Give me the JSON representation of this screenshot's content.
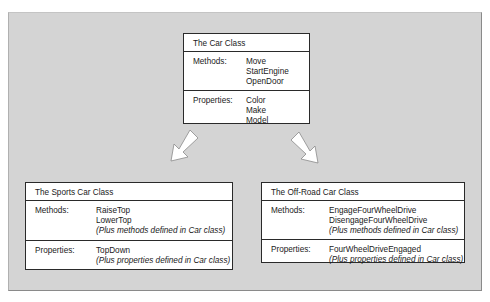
{
  "diagram": {
    "base_class": {
      "title": "The Car Class",
      "methods_label": "Methods:",
      "methods": [
        "Move",
        "StartEngine",
        "OpenDoor"
      ],
      "properties_label": "Properties:",
      "properties": [
        "Color",
        "Make",
        "Model"
      ]
    },
    "derived_classes": [
      {
        "title": "The Sports Car Class",
        "methods_label": "Methods:",
        "methods": [
          "RaiseTop",
          "LowerTop"
        ],
        "methods_note": "(Plus methods defined in Car class)",
        "properties_label": "Properties:",
        "properties": [
          "TopDown"
        ],
        "properties_note": "(Plus properties defined in Car class)"
      },
      {
        "title": "The Off-Road Car Class",
        "methods_label": "Methods:",
        "methods": [
          "EngageFourWheelDrive",
          "DisengageFourWheelDrive"
        ],
        "methods_note": "(Plus methods defined in Car class)",
        "properties_label": "Properties:",
        "properties": [
          "FourWheelDriveEngaged"
        ],
        "properties_note": "(Plus properties defined in Car class)"
      }
    ],
    "arrows": [
      {
        "from": "The Car Class",
        "to": "The Sports Car Class",
        "direction": "down-left"
      },
      {
        "from": "The Car Class",
        "to": "The Off-Road Car Class",
        "direction": "down-right"
      }
    ],
    "colors": {
      "panel_background": "#d4d4d4",
      "box_background": "#ffffff",
      "border": "#2a2a2a",
      "arrow_fill": "#ffffff",
      "arrow_stroke": "#8a8a8a"
    }
  }
}
